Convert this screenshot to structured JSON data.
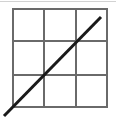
{
  "figure": {
    "title": "",
    "caption": "",
    "background_color": "#ffffff",
    "canvas": {
      "width": 116,
      "height": 118
    }
  },
  "grid": {
    "rows": 3,
    "columns": 3,
    "left": 12,
    "top": 8,
    "right": 108,
    "bottom": 108,
    "width": 96,
    "height": 100,
    "line_color": "#6a6a6a",
    "line_width": 2,
    "vertical_gridlines_x": [
      44,
      76
    ],
    "horizontal_gridlines_y": [
      41,
      75
    ]
  },
  "diagonal": {
    "label": "diagonal-line",
    "color": "#1a1a1a",
    "line_width": 3,
    "x1": 4,
    "y1": 116,
    "x2": 101,
    "y2": 17
  },
  "top_edge_line": {
    "color": "#d2d2d2",
    "line_width": 1,
    "y": 1,
    "x1": 0,
    "x2": 116
  },
  "chart_data": {
    "type": "line",
    "title": "",
    "xlabel": "",
    "ylabel": "",
    "grid": true,
    "legend": "none",
    "xlim": [
      0,
      3
    ],
    "ylim": [
      0,
      3
    ],
    "xticks": [
      0,
      1,
      2,
      3
    ],
    "yticks": [
      0,
      1,
      2,
      3
    ],
    "xticklabels": [
      "",
      "",
      "",
      ""
    ],
    "yticklabels": [
      "",
      "",
      "",
      ""
    ],
    "series": [
      {
        "name": "diagonal",
        "x": [
          -0.25,
          0,
          1,
          2,
          2.78
        ],
        "y": [
          -0.25,
          0,
          1,
          2,
          2.78
        ],
        "color": "#1a1a1a"
      }
    ]
  }
}
